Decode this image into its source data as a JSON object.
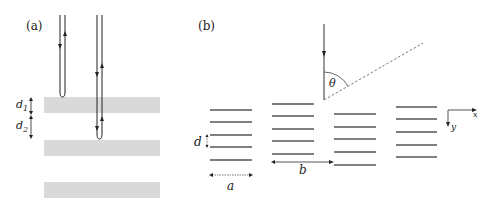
{
  "panel_a": {
    "label": "(a)",
    "layer_color": "#d9d9d9",
    "d1_label": "d",
    "d1_sub": "1",
    "d2_label": "d",
    "d2_sub": "2",
    "layers": 3,
    "waves": [
      {
        "name": "reflected-at-first-surface"
      },
      {
        "name": "reflected-at-second-surface"
      }
    ]
  },
  "panel_b": {
    "label": "(b)",
    "d_label": "d",
    "a_label": "a",
    "b_label": "b",
    "theta_label": "θ",
    "x_axis_label": "x",
    "y_axis_label": "y",
    "line_color": "#555555",
    "stacks": 4
  }
}
